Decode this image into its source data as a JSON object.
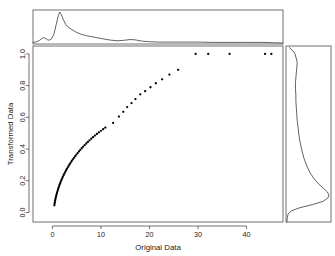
{
  "chart_data": {
    "type": "scatter",
    "title": "",
    "xlabel": "Original Data",
    "ylabel": "Transformed Data",
    "xlim": [
      -4.0,
      47.5
    ],
    "ylim": [
      -0.06,
      1.05
    ],
    "xticks": [
      0,
      10,
      20,
      30,
      40
    ],
    "xticklabels": [
      "0",
      "10",
      "20",
      "30",
      "40"
    ],
    "yticks": [
      0.0,
      0.2,
      0.4,
      0.6,
      0.8,
      1.0
    ],
    "yticklabels": [
      "0.0",
      "0.2",
      "0.4",
      "0.6",
      "0.8",
      "1.0"
    ],
    "grid": false,
    "legend": null,
    "marker": "point",
    "marker_color": "#000000",
    "points": [
      [
        0.4,
        0.045
      ],
      [
        0.45,
        0.055
      ],
      [
        0.5,
        0.065
      ],
      [
        0.55,
        0.075
      ],
      [
        0.62,
        0.085
      ],
      [
        0.7,
        0.095
      ],
      [
        0.78,
        0.105
      ],
      [
        0.86,
        0.115
      ],
      [
        0.95,
        0.125
      ],
      [
        1.05,
        0.135
      ],
      [
        1.15,
        0.145
      ],
      [
        1.25,
        0.155
      ],
      [
        1.36,
        0.165
      ],
      [
        1.48,
        0.175
      ],
      [
        1.6,
        0.185
      ],
      [
        1.73,
        0.195
      ],
      [
        1.86,
        0.205
      ],
      [
        2.0,
        0.215
      ],
      [
        2.15,
        0.225
      ],
      [
        2.3,
        0.235
      ],
      [
        2.46,
        0.245
      ],
      [
        2.62,
        0.255
      ],
      [
        2.8,
        0.265
      ],
      [
        2.98,
        0.275
      ],
      [
        3.17,
        0.285
      ],
      [
        3.36,
        0.295
      ],
      [
        3.56,
        0.305
      ],
      [
        3.77,
        0.315
      ],
      [
        3.99,
        0.325
      ],
      [
        4.21,
        0.335
      ],
      [
        4.45,
        0.345
      ],
      [
        4.69,
        0.355
      ],
      [
        4.94,
        0.365
      ],
      [
        5.2,
        0.375
      ],
      [
        5.47,
        0.385
      ],
      [
        5.75,
        0.395
      ],
      [
        6.04,
        0.405
      ],
      [
        6.34,
        0.415
      ],
      [
        6.65,
        0.425
      ],
      [
        6.97,
        0.435
      ],
      [
        7.3,
        0.445
      ],
      [
        7.64,
        0.455
      ],
      [
        8.0,
        0.465
      ],
      [
        8.37,
        0.475
      ],
      [
        8.75,
        0.485
      ],
      [
        9.15,
        0.495
      ],
      [
        9.56,
        0.505
      ],
      [
        9.99,
        0.515
      ],
      [
        10.44,
        0.525
      ],
      [
        10.9,
        0.535
      ],
      [
        12.5,
        0.565
      ],
      [
        13.7,
        0.605
      ],
      [
        14.6,
        0.635
      ],
      [
        15.4,
        0.665
      ],
      [
        16.3,
        0.69
      ],
      [
        17.1,
        0.715
      ],
      [
        18.1,
        0.745
      ],
      [
        19.1,
        0.765
      ],
      [
        20.2,
        0.79
      ],
      [
        21.3,
        0.815
      ],
      [
        22.6,
        0.84
      ],
      [
        24.1,
        0.87
      ],
      [
        25.9,
        0.9
      ],
      [
        29.5,
        1.0
      ],
      [
        32.1,
        1.0
      ],
      [
        36.5,
        1.0
      ],
      [
        43.8,
        1.0
      ],
      [
        45.1,
        1.0
      ]
    ],
    "top_density": {
      "label": "density of Original Data",
      "x": [
        -4.0,
        -3.2,
        -2.6,
        -2.2,
        -1.9,
        -1.6,
        -1.3,
        -1.0,
        -0.6,
        -0.2,
        0.3,
        0.8,
        1.2,
        1.5,
        1.8,
        2.2,
        2.7,
        3.3,
        4.0,
        5.0,
        6.0,
        7.0,
        8.0,
        9.0,
        10.5,
        12.0,
        13.5,
        15.0,
        16.0,
        17.0,
        18.5,
        20.0,
        22.0,
        24.0,
        26.0,
        28.0,
        30.0,
        33.0,
        36.0,
        40.0,
        43.0,
        45.5,
        47.5
      ],
      "y": [
        0.05,
        0.07,
        0.12,
        0.17,
        0.2,
        0.19,
        0.16,
        0.13,
        0.12,
        0.16,
        0.3,
        0.62,
        0.88,
        1.0,
        0.93,
        0.78,
        0.62,
        0.52,
        0.45,
        0.36,
        0.3,
        0.26,
        0.23,
        0.2,
        0.16,
        0.12,
        0.1,
        0.12,
        0.14,
        0.13,
        0.09,
        0.07,
        0.06,
        0.06,
        0.06,
        0.06,
        0.06,
        0.05,
        0.05,
        0.05,
        0.05,
        0.04,
        0.03
      ]
    },
    "right_density": {
      "label": "density of Transformed Data",
      "y": [
        -0.06,
        -0.03,
        -0.01,
        0.01,
        0.03,
        0.05,
        0.07,
        0.09,
        0.11,
        0.13,
        0.15,
        0.18,
        0.21,
        0.25,
        0.29,
        0.34,
        0.39,
        0.44,
        0.49,
        0.54,
        0.58,
        0.62,
        0.66,
        0.7,
        0.74,
        0.78,
        0.82,
        0.85,
        0.88,
        0.91,
        0.94,
        0.96,
        0.98,
        1.0,
        1.02,
        1.04
      ],
      "x": [
        0.02,
        0.03,
        0.05,
        0.12,
        0.32,
        0.62,
        0.86,
        0.97,
        1.0,
        0.96,
        0.88,
        0.76,
        0.66,
        0.56,
        0.49,
        0.42,
        0.37,
        0.33,
        0.3,
        0.28,
        0.26,
        0.25,
        0.24,
        0.23,
        0.23,
        0.22,
        0.22,
        0.23,
        0.24,
        0.25,
        0.26,
        0.25,
        0.23,
        0.21,
        0.16,
        0.08
      ]
    }
  }
}
